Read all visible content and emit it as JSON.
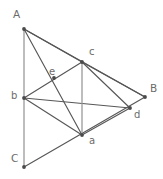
{
  "figure": {
    "kind": "geometry-diagram",
    "canvas": {
      "width": 163,
      "height": 179
    },
    "background_color": "#ffffff",
    "line_color_dark": "#575757",
    "line_color_light": "#9a9a9a",
    "dot_color": "#4a4a4a",
    "label_color": "#6b6b6b",
    "points": [
      {
        "id": "A",
        "label": "A",
        "x": 24,
        "y": 29,
        "label_x": 13,
        "label_y": 9,
        "size": "upper"
      },
      {
        "id": "B",
        "label": "B",
        "x": 145,
        "y": 97,
        "label_x": 150,
        "label_y": 83,
        "size": "upper"
      },
      {
        "id": "C",
        "label": "C",
        "x": 24,
        "y": 167,
        "label_x": 11,
        "label_y": 153,
        "size": "upper"
      },
      {
        "id": "a",
        "label": "a",
        "x": 82,
        "y": 135,
        "label_x": 89,
        "label_y": 136,
        "size": "lower"
      },
      {
        "id": "b",
        "label": "b",
        "x": 24,
        "y": 98,
        "label_x": 11,
        "label_y": 91,
        "size": "lower"
      },
      {
        "id": "c",
        "label": "c",
        "x": 82,
        "y": 62,
        "label_x": 89,
        "label_y": 47,
        "size": "lower"
      },
      {
        "id": "d",
        "label": "d",
        "x": 130,
        "y": 108,
        "label_x": 134,
        "label_y": 110,
        "size": "lower"
      },
      {
        "id": "e",
        "label": "e",
        "x": 54,
        "y": 78,
        "label_x": 49,
        "label_y": 67,
        "size": "lower"
      }
    ],
    "edges": [
      {
        "id": "A-C",
        "from": "A",
        "to": "C",
        "style": "light"
      },
      {
        "id": "A-B",
        "from": "A",
        "to": "B",
        "style": "dark"
      },
      {
        "id": "C-B",
        "from": "C",
        "to": "B",
        "style": "dark"
      },
      {
        "id": "A-c",
        "from": "A",
        "to": "c",
        "style": "dark"
      },
      {
        "id": "A-a",
        "from": "A",
        "to": "a",
        "style": "dark"
      },
      {
        "id": "b-c",
        "from": "b",
        "to": "c",
        "style": "dark"
      },
      {
        "id": "b-d",
        "from": "b",
        "to": "d",
        "style": "dark"
      },
      {
        "id": "b-a",
        "from": "b",
        "to": "a",
        "style": "dark"
      },
      {
        "id": "c-a",
        "from": "c",
        "to": "a",
        "style": "light"
      },
      {
        "id": "c-d",
        "from": "c",
        "to": "d",
        "style": "dark"
      },
      {
        "id": "c-B",
        "from": "c",
        "to": "B",
        "style": "dark"
      },
      {
        "id": "a-d",
        "from": "a",
        "to": "d",
        "style": "dark"
      }
    ]
  }
}
